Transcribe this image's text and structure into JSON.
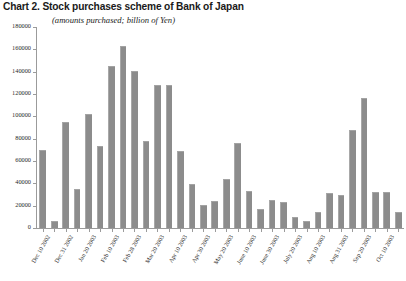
{
  "chart_data": {
    "type": "bar",
    "title": "Chart 2. Stock purchases scheme of Bank of Japan",
    "subtitle": "(amounts purchased; billion of Yen)",
    "xlabel": "",
    "ylabel": "",
    "ylim": [
      0,
      180000
    ],
    "ytick_values": [
      0,
      20000,
      40000,
      60000,
      80000,
      100000,
      120000,
      140000,
      160000,
      180000
    ],
    "ytick_labels": [
      "0",
      "20000",
      "40000",
      "60000",
      "80000",
      "100000",
      "120000",
      "140000",
      "160000",
      "180000"
    ],
    "grid": false,
    "legend": null,
    "bar_color": "#8c8c8c",
    "categories": [
      "Dec 10 2002",
      "Dec 20 2002",
      "Dec 31 2002",
      "Jan 10 2003",
      "Jan 20 2003",
      "Jan 31 2003",
      "Feb 10 2003",
      "Feb 20 2003",
      "Feb 28 2003",
      "Mar 10 2003",
      "Mar 20 2003",
      "Mar 31 2003",
      "Apr 10 2003",
      "Apr 20 2003",
      "Apr 30 2003",
      "May 10 2003",
      "May 20 2003",
      "May 30 2003",
      "June 10 2003",
      "June 20 2003",
      "June 30 2003",
      "July 10 2003",
      "July 20 2003",
      "July 31 2003",
      "Aug 10 2003",
      "Aug 20 2003",
      "Aug 31 2003",
      "Sep 10 2003",
      "Sep 20 2003",
      "Sep 30 2003",
      "Oct 10 2003",
      "Oct 20 2003"
    ],
    "tick_labels_shown": [
      "Dec 10 2002",
      "Dec 31 2002",
      "Jan 20 2003",
      "Feb 10 2003",
      "Feb 28 2003",
      "Mar 20 2003",
      "Apr 10 2003",
      "Apr 30 2003",
      "May 20 2003",
      "June 10 2003",
      "June 30 2003",
      "July 20 2003",
      "Aug 10 2003",
      "Aug 31 2003",
      "Sep 20 2003",
      "Oct 10 2003"
    ],
    "values": [
      70000,
      6500,
      95000,
      35000,
      102000,
      73000,
      145000,
      163000,
      141000,
      78000,
      128000,
      128000,
      69000,
      39000,
      21000,
      24000,
      44000,
      76000,
      33000,
      17000,
      25000,
      23000,
      10000,
      6000,
      14000,
      31000,
      30000,
      88000,
      116000,
      32000,
      32000,
      14000
    ]
  }
}
